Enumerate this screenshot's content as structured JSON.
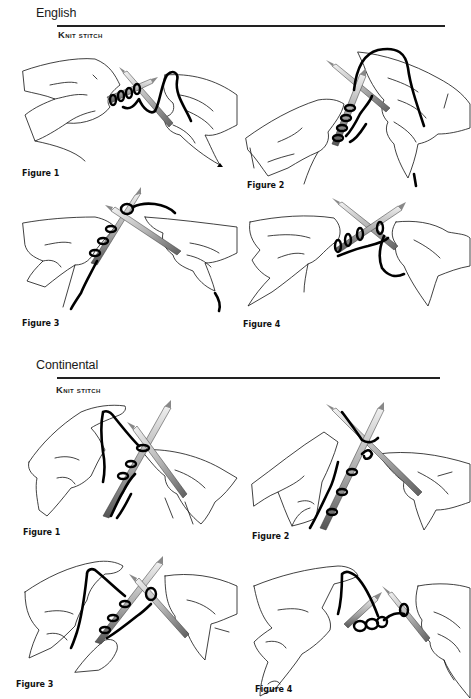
{
  "sections": [
    {
      "title": "English",
      "subhead": "Knit stitch",
      "figures": [
        {
          "caption": "Figure 1"
        },
        {
          "caption": "Figure 2"
        },
        {
          "caption": "Figure 3"
        },
        {
          "caption": "Figure 4"
        }
      ]
    },
    {
      "title": "Continental",
      "subhead": "Knit stitch",
      "figures": [
        {
          "caption": "Figure 1"
        },
        {
          "caption": "Figure 2"
        },
        {
          "caption": "Figure 3"
        },
        {
          "caption": "Figure 4"
        }
      ]
    }
  ],
  "colors": {
    "ink": "#111111",
    "needle_light": "#e6e6e6",
    "needle_dark": "#6e6e6e",
    "background": "#ffffff"
  },
  "icons": {
    "needle": "knitting-needle-icon",
    "yarn": "yarn-strand-icon",
    "hand": "hand-illustration-icon"
  }
}
